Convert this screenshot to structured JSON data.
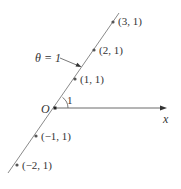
{
  "diagram": {
    "origin_label": "O",
    "x_axis_label": "x",
    "angle_label": "1",
    "line_label": "θ = 1",
    "points": [
      {
        "label": "(3, 1)"
      },
      {
        "label": "(2, 1)"
      },
      {
        "label": "(1, 1)"
      },
      {
        "label": "(−1, 1)"
      },
      {
        "label": "(−2, 1)"
      }
    ],
    "colors": {
      "line": "#8a8a8a",
      "axis": "#555555",
      "point": "#555555",
      "text": "#333333"
    }
  }
}
